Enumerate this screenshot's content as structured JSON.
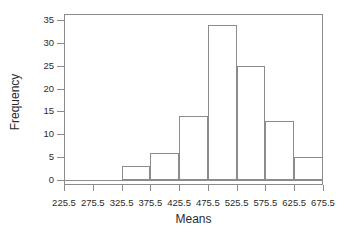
{
  "chart_data": {
    "type": "bar",
    "title": "",
    "subtitle": "",
    "xlabel": "Means",
    "ylabel": "Frequency",
    "categories": [
      "325.5-375.5",
      "375.5-425.5",
      "425.5-475.5",
      "475.5-525.5",
      "525.5-575.5",
      "575.5-625.5",
      "625.5-675.5"
    ],
    "values": [
      3,
      6,
      14,
      34,
      25,
      13,
      5
    ],
    "bin_edges": [
      325.5,
      375.5,
      425.5,
      475.5,
      525.5,
      575.5,
      625.5,
      675.5
    ],
    "bin_width": 50,
    "xlim": [
      225.5,
      675.5
    ],
    "ylim": [
      0,
      35
    ],
    "x_ticks": [
      225.5,
      275.5,
      325.5,
      375.5,
      425.5,
      475.5,
      525.5,
      575.5,
      625.5,
      675.5
    ],
    "x_tick_labels": [
      "225.5",
      "275.5",
      "325.5",
      "375.5",
      "425.5",
      "475.5",
      "525.5",
      "575.5",
      "625.5",
      "675.5"
    ],
    "y_ticks": [
      0,
      5,
      10,
      15,
      20,
      25,
      30,
      35
    ],
    "y_tick_labels": [
      "0",
      "5",
      "10",
      "15",
      "20",
      "25",
      "30",
      "35"
    ],
    "grid": false,
    "legend": false,
    "legend_position": "none",
    "bar_fill_color": "#ffffff",
    "bar_edge_color": "#8c8c8c",
    "axis_color": "#8c8c8c",
    "text_color": "#2b2b2b",
    "background_color": "#ffffff"
  },
  "axes": {
    "x_title": "Means",
    "y_title": "Frequency"
  }
}
